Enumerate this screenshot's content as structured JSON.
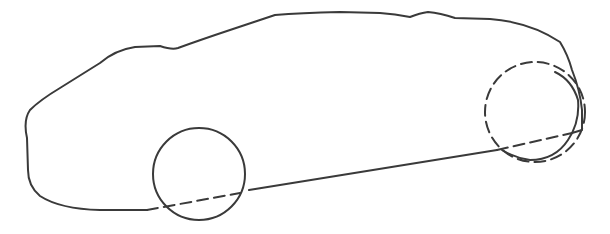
{
  "drawing": {
    "subject": "car-outline-sketch",
    "stroke_color": "#3a3a3a",
    "background_color": "#ffffff",
    "body_outline": "M147,210 L100,210 Q60,209 40,196 Q28,186 28,170 L27,138 Q23,120 30,110 Q40,100 60,88 L100,63 Q115,50 135,47 L160,46 Q172,50 178,48 Q200,40 230,30 L275,15 Q300,13 340,12 L380,13 Q395,14 410,17 Q420,13 428,12 Q440,13 455,18 L490,19 Q530,22 560,42 Q568,55 572,70 Q580,90 582,110 L582,130 L572,133",
    "sill_line": "M249,190 L497,150",
    "front_wheel": {
      "cx": 199,
      "cy": 174,
      "r": 46
    },
    "front_wheel_hidden_line": "M147,210 L240,193",
    "rear_wheel_hidden": {
      "cx": 535,
      "cy": 112,
      "r": 50
    },
    "rear_arch_visible": "M555,72 Q572,80 578,100 Q580,122 568,140 Q555,160 530,160 Q515,158 502,150",
    "rear_wheel_hidden_line": "M497,150 L572,133"
  }
}
